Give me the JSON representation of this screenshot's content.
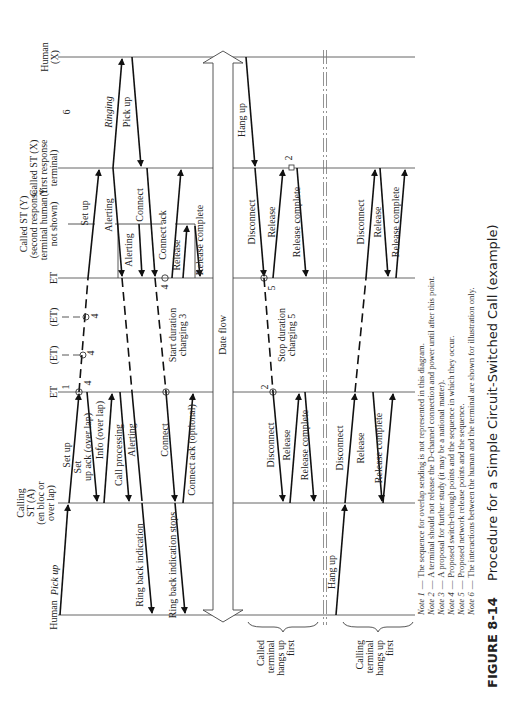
{
  "figure": {
    "number": "FIGURE 8-14",
    "title": "Procedure for a Simple Circuit-Switched Call (example)",
    "orientation": "rotated 90 degrees counter-clockwise"
  },
  "lifelines": [
    {
      "id": "human_x",
      "label": "Human (X)"
    },
    {
      "id": "called_st_x",
      "label": "Called ST (X) (first response terminal)"
    },
    {
      "id": "called_st_y",
      "label": "Called ST (Y) (second response terminal human Y not shown)"
    },
    {
      "id": "et_called",
      "label": "ET"
    },
    {
      "id": "et_transit_1",
      "label": "(ET)"
    },
    {
      "id": "et_transit_2",
      "label": "(ET)"
    },
    {
      "id": "et_calling",
      "label": "ET"
    },
    {
      "id": "calling_st_a",
      "label": "Calling ST (A) (en bloc or over lap)"
    },
    {
      "id": "human_a",
      "label": "Human"
    }
  ],
  "labels": {
    "human_x_1": "Human",
    "human_x_2": "(X)",
    "called_x_1": "Called ST (X)",
    "called_x_2": "(first response",
    "called_x_3": "terminal)",
    "called_y_1": "Called ST (Y)",
    "called_y_2": "(second response",
    "called_y_3": "terminal human Y",
    "called_y_4": "not shown)",
    "et_called": "ET",
    "et_t1": "(ET)",
    "et_t2": "(ET)",
    "et_calling": "ET",
    "calling_1": "Calling",
    "calling_2": "ST (A)",
    "calling_3": "(en bloc or",
    "calling_4": "over lap)",
    "human_a": "Human",
    "note6_marker": "6",
    "note1_marker": "1",
    "note4_marker_a": "4",
    "note4_marker_b": "4",
    "note4_marker_c": "4",
    "note4_marker_d": "4",
    "note2_marker_a": "2",
    "note2_marker_b": "2",
    "note5_marker": "5"
  },
  "messages": {
    "pick_up_a": "Pick up",
    "set_up_a": "Set up",
    "set_up_ack": "Set up ack (over lap)",
    "set_up_ack_1": "Set",
    "set_up_ack_2": "up ack (over lap)",
    "info": "Info (over lap)",
    "call_processing": "Call processing",
    "alerting_a": "Alerting",
    "connect_a": "Connect",
    "connect_ack_opt": "Connect ack (optional)",
    "ring_back": "Ring back indication",
    "ring_back_stops": "Ring back indication stops",
    "set_up_y": "Set up",
    "alerting_x": "Alerting",
    "alerting_y": "Alerting",
    "connect_x": "Connect",
    "connect_ack": "Connect ack",
    "release_y": "Release",
    "release_complete_y": "Release complete",
    "ringing": "Ringing",
    "pick_up_x": "Pick up",
    "start_duration_1": "Start duration",
    "start_duration_2": "charging 3",
    "data_flow": "Date flow",
    "hang_up_x": "Hang up",
    "disconnect_1": "Disconnect",
    "release_1": "Release",
    "release_complete_1": "Release complete",
    "stop_duration_1": "Stop duration",
    "stop_duration_2": "charging 5",
    "disconnect_2": "Disconnect",
    "release_2": "Release",
    "release_complete_2": "Release complete",
    "disconnect_3": "Disconnect",
    "release_3": "Release",
    "release_complete_3": "Release complete",
    "disconnect_4": "Disconnect",
    "release_4": "Release",
    "release_complete_4": "Release complete",
    "hang_up_a": "Hang up"
  },
  "scenarios": {
    "called_first_1": "Called",
    "called_first_2": "terminal",
    "called_first_3": "hangs up",
    "called_first_4": "first",
    "calling_first_1": "Calling",
    "calling_first_2": "terminal",
    "calling_first_3": "hangs up",
    "calling_first_4": "first"
  },
  "notes": [
    {
      "label": "Note 1",
      "text": "The sequence for overlap sending is not represented in this diagram."
    },
    {
      "label": "Note 2",
      "text": "A terminal should not release the D-channel connection and power until after this point."
    },
    {
      "label": "Note 3",
      "text": "A proposal for further study (it may be a national matter)."
    },
    {
      "label": "Note 4",
      "text": "Proposed switch-through points and the sequence in which they occur."
    },
    {
      "label": "Note 5",
      "text": "Proposed network release points and the sequence."
    },
    {
      "label": "Note 6",
      "text": "The interactions between the human and the terminal are shown for illustration only."
    }
  ],
  "note_sep": "—"
}
